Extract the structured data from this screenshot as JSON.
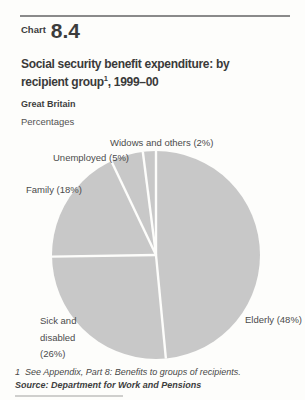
{
  "header": {
    "kicker": "Chart",
    "number": "8.4",
    "title_line1": "Social security benefit expenditure: by",
    "title_line2_pre": "recipient group",
    "title_sup": "1",
    "title_line2_post": ", 1999–00",
    "region": "Great Britain",
    "unit": "Percentages"
  },
  "chart_data": {
    "type": "pie",
    "subtitle": "Great Britain",
    "unit": "Percentages",
    "categories": [
      "Elderly",
      "Sick and disabled",
      "Family",
      "Unemployed",
      "Widows and others"
    ],
    "values": [
      48,
      26,
      18,
      5,
      2
    ],
    "start_angle_deg": 0,
    "direction": "clockwise",
    "legend_position": "labels-around-pie",
    "slice_color": "#c8c8c8",
    "divider_color": "#fdfdfb"
  },
  "footnotes": {
    "note1": "1  See Appendix, Part 8: Benefits to groups of recipients.",
    "source": "Source: Department for Work and Pensions"
  }
}
